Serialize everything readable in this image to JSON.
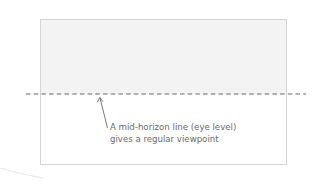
{
  "diagram": {
    "type": "perspective-illustration",
    "frame": {
      "sky_fill": "#f3f3f3",
      "ground_fill": "#ffffff",
      "border_color": "#d4d4d4"
    },
    "horizon_line": {
      "style": "dashed",
      "color": "#6a6a6a",
      "position": "mid"
    },
    "annotation": {
      "pointer": "arrow-up",
      "lines": [
        "A mid-horizon line (eye level)",
        "gives a regular viewpoint"
      ],
      "text_color": "#6a6a6a"
    }
  }
}
